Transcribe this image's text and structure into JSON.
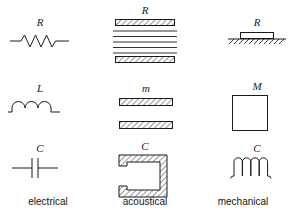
{
  "figure": {
    "background_color": "#ffffff",
    "ink_color": "#1a1a1a",
    "columns": [
      {
        "key": "electrical",
        "label": "electrical"
      },
      {
        "key": "acoustical",
        "label": "acoustical"
      },
      {
        "key": "mechanical",
        "label": "mechanical"
      }
    ],
    "rows": [
      {
        "key": "resistance",
        "electrical_symbol": "R",
        "acoustical_symbol": "R",
        "mechanical_symbol": "R"
      },
      {
        "key": "inertance",
        "electrical_symbol": "L",
        "acoustical_symbol": "m",
        "mechanical_symbol": "M"
      },
      {
        "key": "compliance",
        "electrical_symbol": "C",
        "acoustical_symbol": "C",
        "mechanical_symbol": "C"
      }
    ],
    "cells": {
      "electrical_resistance": {
        "symbol": "R",
        "icon": "resistor-zigzag-icon"
      },
      "acoustical_resistance": {
        "symbol": "R",
        "icon": "acoustic-resistance-screen-icon"
      },
      "mechanical_resistance": {
        "symbol": "R",
        "icon": "mechanical-damper-on-ground-icon"
      },
      "electrical_inertance": {
        "symbol": "L",
        "icon": "inductor-coil-icon"
      },
      "acoustical_inertance": {
        "symbol": "m",
        "icon": "acoustic-mass-plates-icon"
      },
      "mechanical_inertance": {
        "symbol": "M",
        "icon": "mechanical-mass-block-icon"
      },
      "electrical_compliance": {
        "symbol": "C",
        "icon": "capacitor-plates-icon"
      },
      "acoustical_compliance": {
        "symbol": "C",
        "icon": "acoustic-cavity-icon"
      },
      "mechanical_compliance": {
        "symbol": "C",
        "icon": "mechanical-spring-coil-icon"
      }
    }
  }
}
